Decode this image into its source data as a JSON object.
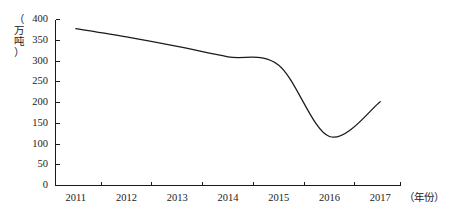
{
  "chart_data": {
    "type": "line",
    "title": "",
    "subtitle": "",
    "xlabel": "（年份）",
    "ylabel": "（万吨）",
    "x": [
      2011,
      2012,
      2013,
      2014,
      2015,
      2016,
      2017
    ],
    "categories": [
      "2011",
      "2012",
      "2013",
      "2014",
      "2015",
      "2016",
      "2017"
    ],
    "series": [
      {
        "name": "产量",
        "values": [
          378,
          358,
          335,
          310,
          290,
          118,
          202
        ]
      }
    ],
    "xlim": [
      2010.6,
      2017.4
    ],
    "ylim": [
      0,
      400
    ],
    "y_ticks": [
      0,
      50,
      100,
      150,
      200,
      250,
      300,
      350,
      400
    ],
    "y_tick_labels": [
      "0",
      "50",
      "100",
      "150",
      "200",
      "250",
      "300",
      "350",
      "400"
    ],
    "x_ticks": [
      2011,
      2012,
      2013,
      2014,
      2015,
      2016,
      2017
    ],
    "x_tick_labels": [
      "2011",
      "2012",
      "2013",
      "2014",
      "2015",
      "2016",
      "2017"
    ],
    "grid": false,
    "legend": false,
    "legend_position": "none",
    "line_color": "#1a1a1a",
    "background_color": "#ffffff",
    "annotations": []
  },
  "axis": {
    "y_unit_label": "（\n万\n吨\n）",
    "x_unit_label": "（年份）"
  }
}
